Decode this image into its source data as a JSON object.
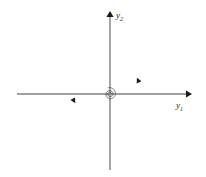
{
  "figure": {
    "title": "",
    "background_color": "#ffffff",
    "width": 206,
    "height": 177
  },
  "axes": {
    "horizontal": {
      "label_base": "y",
      "label_sub": "1",
      "name": "y1-axis",
      "color": "#808080",
      "x_start": 17,
      "x_end": 190,
      "y": 94,
      "arrow": "right"
    },
    "vertical": {
      "label_base": "y",
      "label_sub": "2",
      "name": "y2-axis",
      "color": "#808080",
      "x": 110,
      "y_start": 11,
      "y_end": 170,
      "arrow": "up"
    },
    "origin": {
      "x": 110,
      "y": 94
    }
  },
  "chart_data": {
    "type": "line",
    "title": "",
    "xlabel": "y1",
    "ylabel": "y2",
    "grid": false,
    "legend": null,
    "curve": {
      "name": "outward-spiral-trajectory",
      "color": "#4d4d4d",
      "line_width": 0.8,
      "parametrization": "r(t) = a * exp(b * t), x = cx + r*cos(t), y = cy - r*sin(t)",
      "a": 1.6,
      "b": 0.0972,
      "t_start": 0,
      "t_end": 14.4,
      "direction": "clockwise",
      "center": {
        "x": 110,
        "y": 94
      },
      "axis_crossings_positive_x": [
        114,
        133,
        155,
        185
      ],
      "growth_per_half_turn": 1.35,
      "outer_extent": {
        "left": 22,
        "right": 186,
        "top": 26,
        "bottom": 152
      }
    },
    "arrows": [
      {
        "name": "flow-arrow-right",
        "x": 138,
        "y": 80,
        "angle_deg": 115,
        "color": "#1a1a1a"
      },
      {
        "name": "flow-arrow-left",
        "x": 74,
        "y": 101,
        "angle_deg": 300,
        "color": "#1a1a1a"
      }
    ]
  }
}
